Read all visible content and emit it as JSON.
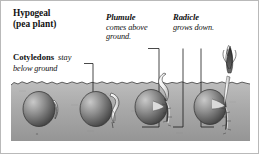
{
  "figure": {
    "kind": "botanical-diagram",
    "border_color": "#b9b9b9",
    "background_color": "#ffffff"
  },
  "title": {
    "term": "Hypogeal",
    "subtitle": "(pea plant)"
  },
  "labels": {
    "cotyledons": {
      "term": "Cotyledons",
      "description": "stay",
      "description_line2": "below ground"
    },
    "plumule": {
      "term": "Plumule",
      "description": "comes above",
      "description_line2": "ground."
    },
    "radicle": {
      "term": "Radicle",
      "description": "grows down."
    }
  },
  "soil": {
    "top_color": "#b4b4b4",
    "bottom_color": "#9a9a9a",
    "surface_line_color": "#4a4a4a",
    "label": "soil-band"
  },
  "seeds": {
    "body_light": "#b0b0b0",
    "body_dark": "#4e4e4e",
    "shoot_color": "#f2f2f2",
    "shoot_outline": "#3a3a3a",
    "plumule_tip_color": "#3c3c3c"
  },
  "stages": [
    {
      "name": "stage-1-dormant-seed",
      "order": 1
    },
    {
      "name": "stage-2-shoot-emerging",
      "order": 2
    },
    {
      "name": "stage-3-radicle-descending",
      "order": 3
    },
    {
      "name": "stage-4-plumule-above-ground",
      "order": 4
    }
  ],
  "leader_lines": {
    "cotyledons_leader": "elbow from cotyledons text down to seed in stage 2",
    "plumule_leader": "elbow from plumule text down to shoot of stage 3",
    "radicle_leader": "bracket from radicle text down to roots of stages 3 and 4"
  }
}
